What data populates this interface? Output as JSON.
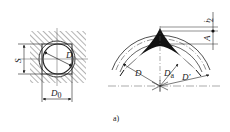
{
  "figure": {
    "caption": "a)",
    "left_view": {
      "labels": {
        "s": "S",
        "d": "D",
        "d0": "D",
        "d0_sub": "0"
      }
    },
    "right_view": {
      "labels": {
        "d": "D",
        "da": "D",
        "da_sub": "a",
        "d_prime": "D'",
        "i": "i",
        "half": "2",
        "a": "A"
      }
    },
    "colors": {
      "line": "#222222",
      "fill": "#111111",
      "background": "#ffffff"
    }
  }
}
